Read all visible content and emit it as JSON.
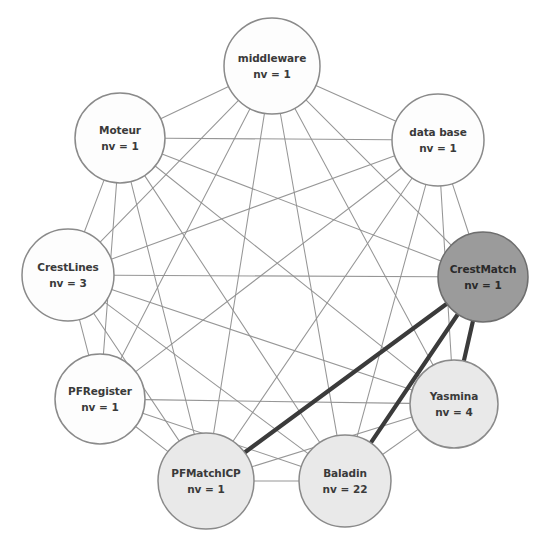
{
  "graph": {
    "type": "node-link-diagram",
    "title": "Software component dependency graph",
    "layout": "circular",
    "width": 544,
    "height": 539,
    "background_color": "#ffffff",
    "nodes": [
      {
        "id": "middleware",
        "label": "middleware",
        "sublabel": "nv = 1",
        "nv": 1,
        "x": 272,
        "y": 66,
        "r": 48,
        "fill": "#fdfdfd",
        "fill_class": "fill-white",
        "highlighted": false
      },
      {
        "id": "moteur",
        "label": "Moteur",
        "sublabel": "nv = 1",
        "nv": 1,
        "x": 120,
        "y": 138,
        "r": 45,
        "fill": "#fdfdfd",
        "fill_class": "fill-white",
        "highlighted": false
      },
      {
        "id": "database",
        "label": "data base",
        "sublabel": "nv = 1",
        "nv": 1,
        "x": 438,
        "y": 140,
        "r": 46,
        "fill": "#fdfdfd",
        "fill_class": "fill-white",
        "highlighted": false
      },
      {
        "id": "crestlines",
        "label": "CrestLines",
        "sublabel": "nv = 3",
        "nv": 3,
        "x": 68,
        "y": 275,
        "r": 46,
        "fill": "#fdfdfd",
        "fill_class": "fill-white",
        "highlighted": false
      },
      {
        "id": "crestmatch",
        "label": "CrestMatch",
        "sublabel": "nv = 1",
        "nv": 1,
        "x": 483,
        "y": 277,
        "r": 45,
        "fill": "#9b9b9b",
        "fill_class": "fill-dark",
        "highlighted": true
      },
      {
        "id": "pfregister",
        "label": "PFRegister",
        "sublabel": "nv = 1",
        "nv": 1,
        "x": 100,
        "y": 399,
        "r": 45,
        "fill": "#fdfdfd",
        "fill_class": "fill-white",
        "highlighted": false
      },
      {
        "id": "pfmatchicp",
        "label": "PFMatchICP",
        "sublabel": "nv = 1",
        "nv": 1,
        "x": 206,
        "y": 481,
        "r": 48,
        "fill": "#e9e9e9",
        "fill_class": "fill-light",
        "highlighted": false
      },
      {
        "id": "baladin",
        "label": "Baladin",
        "sublabel": "nv = 22",
        "nv": 22,
        "x": 345,
        "y": 481,
        "r": 46,
        "fill": "#e9e9e9",
        "fill_class": "fill-light",
        "highlighted": false
      },
      {
        "id": "yasmina",
        "label": "Yasmina",
        "sublabel": "nv = 4",
        "nv": 4,
        "x": 454,
        "y": 404,
        "r": 44,
        "fill": "#e9e9e9",
        "fill_class": "fill-light",
        "highlighted": false
      }
    ],
    "edges_thin": [
      [
        "middleware",
        "moteur"
      ],
      [
        "middleware",
        "database"
      ],
      [
        "middleware",
        "crestlines"
      ],
      [
        "middleware",
        "crestmatch"
      ],
      [
        "middleware",
        "pfregister"
      ],
      [
        "middleware",
        "pfmatchicp"
      ],
      [
        "middleware",
        "baladin"
      ],
      [
        "middleware",
        "yasmina"
      ],
      [
        "moteur",
        "database"
      ],
      [
        "moteur",
        "crestlines"
      ],
      [
        "moteur",
        "crestmatch"
      ],
      [
        "moteur",
        "pfregister"
      ],
      [
        "moteur",
        "pfmatchicp"
      ],
      [
        "moteur",
        "baladin"
      ],
      [
        "moteur",
        "yasmina"
      ],
      [
        "database",
        "crestlines"
      ],
      [
        "database",
        "crestmatch"
      ],
      [
        "database",
        "pfregister"
      ],
      [
        "database",
        "pfmatchicp"
      ],
      [
        "database",
        "baladin"
      ],
      [
        "database",
        "yasmina"
      ],
      [
        "crestlines",
        "crestmatch"
      ],
      [
        "crestlines",
        "pfregister"
      ],
      [
        "crestlines",
        "pfmatchicp"
      ],
      [
        "crestlines",
        "baladin"
      ],
      [
        "crestlines",
        "yasmina"
      ],
      [
        "pfregister",
        "pfmatchicp"
      ],
      [
        "pfregister",
        "baladin"
      ],
      [
        "pfregister",
        "yasmina"
      ],
      [
        "pfmatchicp",
        "baladin"
      ],
      [
        "pfmatchicp",
        "yasmina"
      ],
      [
        "baladin",
        "yasmina"
      ]
    ],
    "edges_thick": [
      [
        "crestmatch",
        "pfmatchicp"
      ],
      [
        "crestmatch",
        "baladin"
      ],
      [
        "crestmatch",
        "yasmina"
      ]
    ],
    "edge_colors": {
      "thin": "#8d8d8d",
      "thick": "#3b3b3b"
    }
  }
}
